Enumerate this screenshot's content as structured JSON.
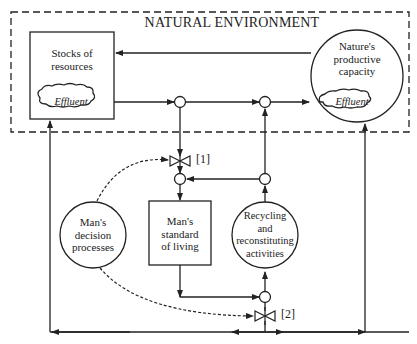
{
  "diagram": {
    "title": "NATURAL ENVIRONMENT",
    "nodes": {
      "stocks": {
        "label_line1": "Stocks of",
        "label_line2": "resources",
        "effluent": "Effluent"
      },
      "nature": {
        "label_line1": "Nature's",
        "label_line2": "productive",
        "label_line3": "capacity",
        "effluent": "Effluent"
      },
      "decision": {
        "label_line1": "Man's",
        "label_line2": "decision",
        "label_line3": "processes"
      },
      "standard": {
        "label_line1": "Man's",
        "label_line2": "standard",
        "label_line3": "of living"
      },
      "recycling": {
        "label_line1": "Recycling",
        "label_line2": "and",
        "label_line3": "reconstituting",
        "label_line4": "activities"
      }
    },
    "valves": [
      {
        "id": "valve-1",
        "label": "[1]"
      },
      {
        "id": "valve-2",
        "label": "[2]"
      }
    ],
    "colors": {
      "line": "#222222",
      "background": "#ffffff"
    }
  }
}
